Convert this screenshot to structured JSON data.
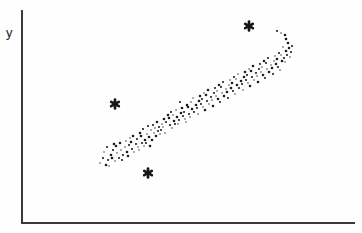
{
  "figure": {
    "background": "#fefefe",
    "axis_color": "#3a3a3a",
    "dot_color": "#1d1d1d",
    "outlier_color": "#161616"
  },
  "chart_data": {
    "type": "scatter",
    "title": "",
    "xlabel": "",
    "ylabel": "y",
    "grid": false,
    "axis_ticks": "none",
    "legend": "none",
    "series": [
      {
        "name": "cloud",
        "marker": "dot",
        "points_px": [
          [
            100,
            163
          ],
          [
            103,
            158
          ],
          [
            106,
            165
          ],
          [
            104,
            152
          ],
          [
            108,
            160
          ],
          [
            111,
            155
          ],
          [
            109,
            166
          ],
          [
            113,
            150
          ],
          [
            112,
            158
          ],
          [
            115,
            161
          ],
          [
            107,
            147
          ],
          [
            114,
            144
          ],
          [
            117,
            153
          ],
          [
            119,
            158
          ],
          [
            116,
            146
          ],
          [
            121,
            150
          ],
          [
            123,
            155
          ],
          [
            120,
            143
          ],
          [
            125,
            147
          ],
          [
            122,
            160
          ],
          [
            127,
            152
          ],
          [
            126,
            141
          ],
          [
            129,
            145
          ],
          [
            128,
            156
          ],
          [
            130,
            138
          ],
          [
            132,
            149
          ],
          [
            131,
            142
          ],
          [
            134,
            152
          ],
          [
            136,
            144
          ],
          [
            133,
            136
          ],
          [
            138,
            147
          ],
          [
            137,
            139
          ],
          [
            140,
            133
          ],
          [
            139,
            150
          ],
          [
            142,
            143
          ],
          [
            141,
            136
          ],
          [
            144,
            146
          ],
          [
            143,
            129
          ],
          [
            145,
            140
          ],
          [
            147,
            134
          ],
          [
            146,
            143
          ],
          [
            149,
            137
          ],
          [
            151,
            130
          ],
          [
            148,
            126
          ],
          [
            152,
            140
          ],
          [
            154,
            133
          ],
          [
            153,
            125
          ],
          [
            156,
            136
          ],
          [
            155,
            128
          ],
          [
            158,
            131
          ],
          [
            157,
            122
          ],
          [
            160,
            134
          ],
          [
            159,
            127
          ],
          [
            150,
            146
          ],
          [
            162,
            124
          ],
          [
            161,
            130
          ],
          [
            164,
            119
          ],
          [
            163,
            127
          ],
          [
            166,
            122
          ],
          [
            168,
            115
          ],
          [
            165,
            133
          ],
          [
            170,
            125
          ],
          [
            169,
            118
          ],
          [
            172,
            128
          ],
          [
            171,
            112
          ],
          [
            174,
            121
          ],
          [
            173,
            115
          ],
          [
            175,
            124
          ],
          [
            177,
            117
          ],
          [
            176,
            110
          ],
          [
            179,
            120
          ],
          [
            181,
            113
          ],
          [
            178,
            124
          ],
          [
            183,
            116
          ],
          [
            182,
            108
          ],
          [
            185,
            119
          ],
          [
            184,
            112
          ],
          [
            187,
            105
          ],
          [
            186,
            122
          ],
          [
            189,
            114
          ],
          [
            188,
            107
          ],
          [
            190,
            117
          ],
          [
            180,
            102
          ],
          [
            192,
            109
          ],
          [
            191,
            102
          ],
          [
            194,
            112
          ],
          [
            196,
            105
          ],
          [
            193,
            98
          ],
          [
            197,
            108
          ],
          [
            199,
            101
          ],
          [
            198,
            114
          ],
          [
            201,
            104
          ],
          [
            200,
            96
          ],
          [
            203,
            107
          ],
          [
            202,
            99
          ],
          [
            205,
            110
          ],
          [
            204,
            93
          ],
          [
            207,
            101
          ],
          [
            206,
            95
          ],
          [
            209,
            104
          ],
          [
            211,
            97
          ],
          [
            208,
            90
          ],
          [
            212,
            100
          ],
          [
            214,
            93
          ],
          [
            213,
            106
          ],
          [
            216,
            96
          ],
          [
            215,
            88
          ],
          [
            218,
            99
          ],
          [
            217,
            91
          ],
          [
            220,
            102
          ],
          [
            219,
            85
          ],
          [
            222,
            93
          ],
          [
            221,
            87
          ],
          [
            224,
            96
          ],
          [
            226,
            89
          ],
          [
            223,
            82
          ],
          [
            227,
            92
          ],
          [
            229,
            85
          ],
          [
            228,
            98
          ],
          [
            231,
            88
          ],
          [
            230,
            80
          ],
          [
            233,
            91
          ],
          [
            232,
            83
          ],
          [
            235,
            94
          ],
          [
            234,
            77
          ],
          [
            237,
            85
          ],
          [
            236,
            79
          ],
          [
            239,
            88
          ],
          [
            241,
            81
          ],
          [
            238,
            74
          ],
          [
            242,
            84
          ],
          [
            244,
            77
          ],
          [
            243,
            90
          ],
          [
            246,
            80
          ],
          [
            245,
            72
          ],
          [
            248,
            83
          ],
          [
            247,
            75
          ],
          [
            250,
            86
          ],
          [
            249,
            69
          ],
          [
            252,
            77
          ],
          [
            251,
            71
          ],
          [
            254,
            80
          ],
          [
            256,
            73
          ],
          [
            253,
            66
          ],
          [
            257,
            76
          ],
          [
            259,
            69
          ],
          [
            258,
            82
          ],
          [
            261,
            72
          ],
          [
            260,
            64
          ],
          [
            263,
            75
          ],
          [
            262,
            67
          ],
          [
            265,
            78
          ],
          [
            264,
            61
          ],
          [
            267,
            69
          ],
          [
            266,
            63
          ],
          [
            269,
            72
          ],
          [
            271,
            65
          ],
          [
            268,
            58
          ],
          [
            272,
            68
          ],
          [
            274,
            61
          ],
          [
            273,
            74
          ],
          [
            276,
            64
          ],
          [
            275,
            56
          ],
          [
            278,
            67
          ],
          [
            277,
            59
          ],
          [
            280,
            70
          ],
          [
            279,
            53
          ],
          [
            282,
            61
          ],
          [
            281,
            55
          ],
          [
            284,
            58
          ],
          [
            286,
            51
          ],
          [
            283,
            47
          ],
          [
            287,
            55
          ],
          [
            289,
            48
          ],
          [
            285,
            62
          ],
          [
            291,
            52
          ],
          [
            288,
            43
          ],
          [
            290,
            57
          ],
          [
            292,
            46
          ],
          [
            286,
            39
          ],
          [
            281,
            33
          ],
          [
            277,
            31
          ],
          [
            285,
            35
          ]
        ]
      },
      {
        "name": "outliers",
        "marker": "asterisk",
        "points_px": [
          [
            249,
            26
          ],
          [
            115,
            104
          ],
          [
            148,
            173
          ]
        ]
      }
    ]
  }
}
